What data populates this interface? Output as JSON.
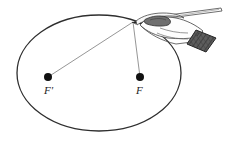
{
  "figure": {
    "background_color": "#ffffff",
    "ink_color": "#2b2b2b",
    "string_color": "#7b7b7b",
    "cuff_color": "#5a5a5a",
    "width": 228,
    "height": 149
  },
  "ellipse": {
    "name": "ellipse-curve",
    "center_x": 99,
    "center_y": 73,
    "radius_x": 82,
    "radius_y": 58,
    "stroke_color": "#2e2e2e",
    "stroke_width": 1.3,
    "fill": "none"
  },
  "foci": [
    {
      "id": "focus-left",
      "label": "F'",
      "x": 48,
      "y": 77,
      "dot_radius": 4,
      "dot_color": "#111111",
      "label_x": 44,
      "label_y": 85
    },
    {
      "id": "focus-right",
      "label": "F",
      "x": 140,
      "y": 77,
      "dot_radius": 4,
      "dot_color": "#111111",
      "label_x": 136,
      "label_y": 85
    }
  ],
  "string": {
    "name": "taut-string",
    "apex_x": 133,
    "apex_y": 22,
    "color": "#8a8a8a",
    "width": 0.9,
    "segments": [
      {
        "id": "string-to-left-focus",
        "from": "apex",
        "to": "focus-left"
      },
      {
        "id": "string-to-right-focus",
        "from": "apex",
        "to": "focus-right"
      }
    ]
  },
  "pencil": {
    "name": "pencil",
    "tip_x": 133,
    "tip_y": 22,
    "end_x": 222,
    "end_y": 9,
    "body_color": "#5f5f5f",
    "tip_color": "#232323"
  },
  "hand": {
    "name": "hand-holding-pencil",
    "outline_color": "#4a4a4a",
    "fill_color": "#fdfdfd",
    "shade_color": "#6e6e6e",
    "cuff": {
      "name": "sleeve-cuff",
      "fill_color": "#5d5d5d",
      "outline_color": "#2a2a2a"
    }
  },
  "labels": {
    "left_focus": "F'",
    "right_focus": "F"
  }
}
